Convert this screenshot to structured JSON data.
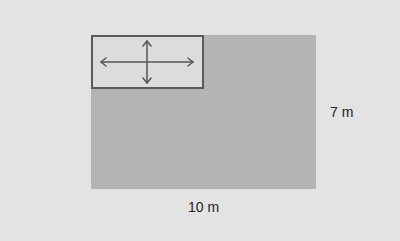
{
  "diagram": {
    "large_rectangle": {
      "width_label": "10 m",
      "height_label": "7 m",
      "color": "#b4b4b4"
    },
    "small_rectangle": {
      "icon": "move-arrows-icon",
      "color": "#dcdcdc",
      "border_color": "#5a5a5a"
    },
    "background_color": "#e3e3e3"
  }
}
